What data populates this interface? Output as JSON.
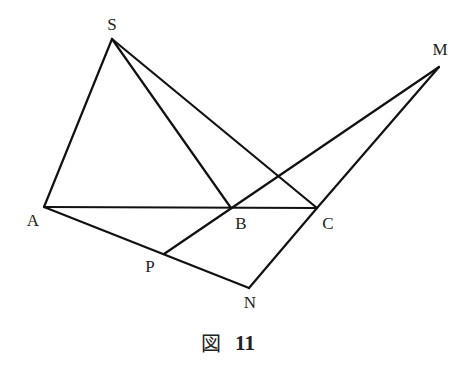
{
  "figure": {
    "caption_prefix": "図",
    "caption_number": "11",
    "line_color": "#111111",
    "text_color": "#222222"
  },
  "points": {
    "S": {
      "label": "S",
      "x": 112,
      "y": 39,
      "lx": 112,
      "ly": 26
    },
    "A": {
      "label": "A",
      "x": 44,
      "y": 207,
      "lx": 33,
      "ly": 222
    },
    "B": {
      "label": "B",
      "x": 231,
      "y": 208,
      "lx": 241,
      "ly": 225
    },
    "C": {
      "label": "C",
      "x": 317,
      "y": 208,
      "lx": 328,
      "ly": 225
    },
    "M": {
      "label": "M",
      "x": 439,
      "y": 67,
      "lx": 440,
      "ly": 51
    },
    "P": {
      "label": "P",
      "x": 164,
      "y": 254,
      "lx": 150,
      "ly": 268
    },
    "N": {
      "label": "N",
      "x": 249,
      "y": 288,
      "lx": 250,
      "ly": 304
    }
  },
  "segments": [
    [
      "S",
      "A"
    ],
    [
      "S",
      "B"
    ],
    [
      "S",
      "C"
    ],
    [
      "A",
      "C"
    ],
    [
      "A",
      "N"
    ],
    [
      "P",
      "M"
    ],
    [
      "C",
      "M"
    ],
    [
      "C",
      "N"
    ]
  ]
}
